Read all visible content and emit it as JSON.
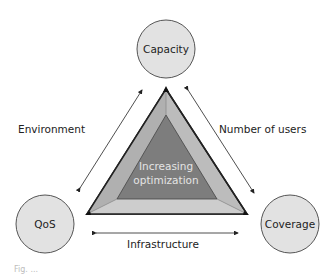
{
  "diagram": {
    "nodes": [
      {
        "id": "capacity",
        "label": "Capacity"
      },
      {
        "id": "qos",
        "label": "QoS"
      },
      {
        "id": "coverage",
        "label": "Coverage"
      }
    ],
    "edges": [
      {
        "from": "qos",
        "to": "capacity",
        "label": "Environment"
      },
      {
        "from": "capacity",
        "to": "coverage",
        "label": "Number of users"
      },
      {
        "from": "qos",
        "to": "coverage",
        "label": "Infrastructure"
      }
    ],
    "center": {
      "line1": "Increasing",
      "line2": "optimization"
    },
    "colors": {
      "circle_fill": "#e2e2e2",
      "outer_triangle": "#bcbcbc",
      "inner_triangle": "#7d7d7d",
      "stroke": "#222222"
    }
  },
  "caption": "Fig. ..."
}
